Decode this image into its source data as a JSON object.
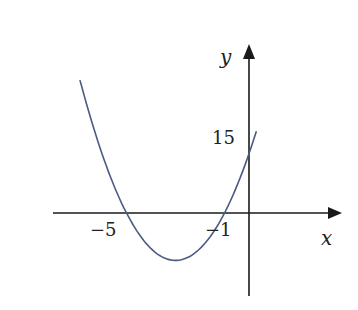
{
  "chart_data": {
    "type": "line",
    "title": "",
    "xlabel": "x",
    "ylabel": "y",
    "function": "y = 3(x + 1)(x + 5) = 3x^2 + 18x + 15",
    "annotations": {
      "x_intercepts": [
        -5,
        -1
      ],
      "y_intercept": 15,
      "vertex": [
        -3,
        -12
      ]
    },
    "tick_labels": {
      "x": [
        "−5",
        "−1"
      ],
      "y": [
        "15"
      ]
    },
    "xlim": [
      -7.0,
      3.8
    ],
    "ylim": [
      -16,
      33
    ],
    "grid": false,
    "legend": null,
    "series": [
      {
        "name": "parabola",
        "color": "#4a5a80",
        "x": [
          -6.9,
          -6,
          -5,
          -4,
          -3,
          -2,
          -1,
          0,
          0.3
        ],
        "y": [
          18.63,
          15,
          0,
          -9,
          -12,
          -9,
          0,
          15,
          20.67
        ]
      }
    ]
  },
  "labels": {
    "x_axis": "x",
    "y_axis": "y",
    "tick_x_neg5": "−5",
    "tick_x_neg1": "−1",
    "tick_y_15": "15"
  },
  "colors": {
    "axis": "#1a1a1a",
    "curve": "#4a5a80",
    "background": "#ffffff"
  }
}
